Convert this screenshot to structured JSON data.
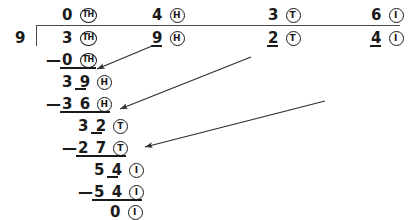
{
  "problem": {
    "title": "Long division 3924 divided by 9",
    "divisor": "9",
    "dividend": "3924",
    "quotient": "0436"
  },
  "place_values": {
    "th": "TH",
    "h": "H",
    "t": "T",
    "i": "I"
  },
  "quotient_row": {
    "th": "0",
    "h": "4",
    "t": "3",
    "i": "6"
  },
  "dividend_row": {
    "th": "3",
    "h": "9",
    "t": "2",
    "i": "4"
  },
  "steps": [
    {
      "minus": "—",
      "value": "0",
      "place": "TH"
    },
    {
      "minus": "",
      "value": "39",
      "place": "H"
    },
    {
      "minus": "—",
      "value": "36",
      "place": "H"
    },
    {
      "minus": "",
      "value": "32",
      "place": "T"
    },
    {
      "minus": "—",
      "value": "27",
      "place": "T"
    },
    {
      "minus": "",
      "value": "54",
      "place": "I"
    },
    {
      "minus": "—",
      "value": "54",
      "place": "I"
    },
    {
      "minus": "",
      "value": "0",
      "place": "I"
    }
  ],
  "step_digits": {
    "s0_d1": "0",
    "s1_d1": "3",
    "s1_d2": "9",
    "s2_d1": "3",
    "s2_d2": "6",
    "s3_d1": "3",
    "s3_d2": "2",
    "s4_d1": "2",
    "s4_d2": "7",
    "s5_d1": "5",
    "s5_d2": "4",
    "s6_d1": "5",
    "s6_d2": "4",
    "s7_d1": "0"
  },
  "minus_signs": {
    "m0": "—",
    "m2": "—",
    "m4": "—",
    "m6": "—"
  },
  "arrows": {
    "count": 3,
    "description": "bring-down arrows from dividend digits to working rows",
    "color": "#2b2b2b"
  },
  "colors": {
    "ink": "#1a1a1a",
    "rule": "#4a4a4a",
    "background": "#ffffff"
  }
}
